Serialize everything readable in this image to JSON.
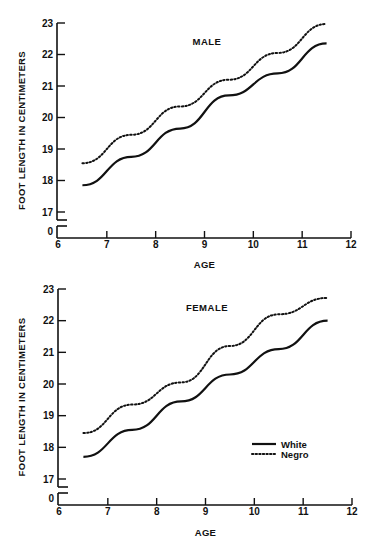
{
  "chart_data": [
    {
      "type": "line",
      "title": "MALE",
      "xlabel": "AGE",
      "ylabel": "FOOT LENGTH IN CENTIMETERS",
      "x": [
        6.5,
        7.5,
        8.5,
        9.5,
        10.5,
        11.5
      ],
      "series": [
        {
          "name": "White",
          "style": "solid",
          "values": [
            17.85,
            18.75,
            19.65,
            20.7,
            21.4,
            22.35
          ]
        },
        {
          "name": "Negro",
          "style": "dotted",
          "values": [
            18.55,
            19.45,
            20.35,
            21.2,
            22.05,
            22.97
          ]
        }
      ],
      "xticks": [
        6,
        7,
        8,
        9,
        10,
        11,
        12
      ],
      "yticks": [
        0,
        17,
        18,
        19,
        20,
        21,
        22,
        23
      ],
      "xlim": [
        6,
        12
      ],
      "ylim": [
        17,
        23
      ],
      "y_axis_break": true,
      "grid": false
    },
    {
      "type": "line",
      "title": "FEMALE",
      "xlabel": "AGE",
      "ylabel": "FOOT LENGTH IN CENTIMETERS",
      "x": [
        6.5,
        7.5,
        8.5,
        9.5,
        10.5,
        11.5
      ],
      "series": [
        {
          "name": "White",
          "style": "solid",
          "values": [
            17.7,
            18.55,
            19.45,
            20.3,
            21.1,
            22.0
          ]
        },
        {
          "name": "Negro",
          "style": "dotted",
          "values": [
            18.45,
            19.35,
            20.05,
            21.2,
            22.2,
            22.72
          ]
        }
      ],
      "xticks": [
        6,
        7,
        8,
        9,
        10,
        11,
        12
      ],
      "yticks": [
        0,
        17,
        18,
        19,
        20,
        21,
        22,
        23
      ],
      "xlim": [
        6,
        12
      ],
      "ylim": [
        17,
        23
      ],
      "y_axis_break": true,
      "grid": false,
      "legend": {
        "position": "lower right",
        "entries": [
          "White",
          "Negro"
        ]
      }
    }
  ],
  "panels": [
    {
      "title": "MALE",
      "xlabel": "AGE",
      "ylabel": "FOOT LENGTH IN CENTIMETERS"
    },
    {
      "title": "FEMALE",
      "xlabel": "AGE",
      "ylabel": "FOOT LENGTH IN CENTIMETERS"
    }
  ],
  "legend": {
    "white": "White",
    "negro": "Negro"
  },
  "colors": {
    "ink": "#111111",
    "background": "#ffffff"
  }
}
